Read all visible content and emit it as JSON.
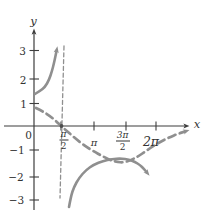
{
  "labels": {
    "y_axis": "y",
    "x_axis": "x",
    "y3": "3",
    "y2": "2",
    "y1": "1",
    "origin": "0",
    "ym1": "−1",
    "ym2": "−2",
    "ym3": "−3",
    "pi": "π",
    "two_pi": "2π",
    "pi_over_2_num": "π",
    "pi_over_2_den": "2",
    "three_pi_over_2_num": "3π",
    "three_pi_over_2_den": "2"
  },
  "chart_data": {
    "type": "line",
    "title": "",
    "xlabel": "x",
    "ylabel": "y",
    "x_tick_labels": [
      "π/2",
      "π",
      "3π/2",
      "2π"
    ],
    "y_tick_labels": [
      -3,
      -2,
      -1,
      1,
      2,
      3
    ],
    "xlim_rad": [
      0,
      7.9
    ],
    "ylim": [
      -3.5,
      3.5
    ],
    "grid": false,
    "legend": "none",
    "asymptote": {
      "style": "dashed-vertical",
      "x_label": "π/2"
    },
    "series": [
      {
        "name": "solid upper branch (rises to +infinity toward x = π/2)",
        "style": "solid",
        "points_est_units": [
          [
            0,
            1.3
          ],
          [
            0.35,
            1.6
          ],
          [
            0.75,
            2.3
          ],
          [
            1.1,
            3.1
          ]
        ]
      },
      {
        "name": "solid lower branch (U-shape opening downward near y = -1.3)",
        "style": "solid",
        "points_est_units": [
          [
            1.8,
            -3.2
          ],
          [
            2.3,
            -1.9
          ],
          [
            3.0,
            -1.5
          ],
          [
            3.7,
            -1.37
          ],
          [
            4.5,
            -1.33
          ],
          [
            5.2,
            -1.5
          ],
          [
            5.8,
            -1.9
          ]
        ]
      },
      {
        "name": "dashed guide curve (cosine-like)",
        "style": "dashed",
        "points_est_units": [
          [
            0.05,
            0.73
          ],
          [
            0.8,
            0.35
          ],
          [
            1.57,
            0
          ],
          [
            2.4,
            -0.65
          ],
          [
            3.14,
            -1.04
          ],
          [
            4.4,
            -1.47
          ],
          [
            5.76,
            -1.02
          ],
          [
            6.8,
            -0.53
          ],
          [
            7.8,
            -0.22
          ]
        ]
      }
    ]
  },
  "render": {
    "colors": {
      "curve": "#8f8f8f",
      "axis": "#3d3d3d",
      "text": "#333333",
      "dot": "#4d4d4d"
    },
    "axes": [
      {
        "name": "x-axis",
        "pts": [
          [
            4,
            126
          ],
          [
            185,
            126
          ]
        ],
        "w": 1.2,
        "marker": "arrow-dark"
      },
      {
        "name": "y-axis",
        "pts": [
          [
            34,
            210
          ],
          [
            34,
            33
          ]
        ],
        "w": 1.2,
        "marker": "arrow-dark"
      }
    ],
    "curves": [
      {
        "name": "secant-upper-branch-curve",
        "w": 2.6,
        "dash": null,
        "marker": "arrow-gray",
        "pts": [
          [
            35,
            94
          ],
          [
            40,
            91
          ],
          [
            45,
            87
          ],
          [
            49,
            80
          ],
          [
            52,
            71
          ],
          [
            54,
            63
          ],
          [
            55.5,
            56
          ],
          [
            56.5,
            51
          ]
        ]
      },
      {
        "name": "secant-lower-branch-curve",
        "w": 2.6,
        "dash": null,
        "marker": "arrow-gray",
        "pts": [
          [
            69,
            207
          ],
          [
            71,
            196
          ],
          [
            74,
            187
          ],
          [
            79,
            178
          ],
          [
            86,
            170
          ],
          [
            94,
            164.5
          ],
          [
            103,
            161
          ],
          [
            112,
            159
          ],
          [
            121,
            158.5
          ],
          [
            129,
            159.5
          ],
          [
            135,
            162
          ],
          [
            140,
            165
          ],
          [
            144,
            169
          ],
          [
            146.5,
            172
          ]
        ]
      },
      {
        "name": "cosine-dashed-curve",
        "w": 2.7,
        "dash": "7.5 4.5",
        "marker": "arrow-gray",
        "pts": [
          [
            36,
            108
          ],
          [
            43,
            111.5
          ],
          [
            50,
            116
          ],
          [
            56,
            121
          ],
          [
            61,
            126
          ],
          [
            68,
            132
          ],
          [
            76,
            139
          ],
          [
            85,
            146
          ],
          [
            94,
            151.5
          ],
          [
            102,
            156
          ],
          [
            110,
            160
          ],
          [
            117,
            162
          ],
          [
            124,
            162.5
          ],
          [
            131,
            160
          ],
          [
            138,
            156.5
          ],
          [
            146,
            151
          ],
          [
            154,
            145.5
          ],
          [
            162,
            141
          ],
          [
            170,
            137
          ],
          [
            178,
            133.8
          ],
          [
            185,
            131.5
          ]
        ]
      },
      {
        "name": "vertical-asymptote-line",
        "w": 1.3,
        "dash": "4 2.8",
        "marker": null,
        "pts": [
          [
            64,
            46
          ],
          [
            60,
            198
          ]
        ]
      }
    ],
    "ticks": [
      {
        "name": "y-tick-3",
        "x1": 29.5,
        "y1": 50.5,
        "x2": 39,
        "y2": 50.5
      },
      {
        "name": "y-tick-2",
        "x1": 29.5,
        "y1": 79,
        "x2": 39,
        "y2": 79
      },
      {
        "name": "y-tick-1",
        "x1": 29.5,
        "y1": 103.5,
        "x2": 39,
        "y2": 103.5
      },
      {
        "name": "y-tick-m1",
        "x1": 29.5,
        "y1": 150,
        "x2": 39,
        "y2": 150
      },
      {
        "name": "y-tick-m2",
        "x1": 29.5,
        "y1": 177,
        "x2": 39,
        "y2": 177
      },
      {
        "name": "y-tick-m3",
        "x1": 29.5,
        "y1": 200,
        "x2": 39,
        "y2": 200
      },
      {
        "name": "x-tick-pi-over-2",
        "x1": 61,
        "y1": 121.5,
        "x2": 61,
        "y2": 130.5
      },
      {
        "name": "x-tick-pi",
        "x1": 94,
        "y1": 121.5,
        "x2": 94,
        "y2": 130.5
      },
      {
        "name": "x-tick-3pi-over-2",
        "x1": 126,
        "y1": 121.5,
        "x2": 126,
        "y2": 130.5
      },
      {
        "name": "x-tick-2pi",
        "x1": 156,
        "y1": 121.5,
        "x2": 156,
        "y2": 130.5
      }
    ],
    "dots": [
      {
        "name": "curve-axis-intersection-dot",
        "x": 61.5,
        "y": 126,
        "r": 1.9
      }
    ],
    "labels": [
      {
        "name": "y-axis-label",
        "bind": "labels.y_axis",
        "x": 33.5,
        "y": 22,
        "size": 11.5,
        "it": true
      },
      {
        "name": "x-axis-label",
        "bind": "labels.x_axis",
        "x": 197,
        "y": 125,
        "size": 11.5,
        "it": true
      },
      {
        "name": "y-tick-label-3",
        "bind": "labels.y3",
        "x": 22.5,
        "y": 50.5,
        "size": 10.5
      },
      {
        "name": "y-tick-label-2",
        "bind": "labels.y2",
        "x": 23,
        "y": 79.5,
        "size": 10.5
      },
      {
        "name": "y-tick-label-1",
        "bind": "labels.y1",
        "x": 23.5,
        "y": 103.5,
        "size": 10.5
      },
      {
        "name": "origin-label",
        "bind": "labels.origin",
        "x": 28.5,
        "y": 135,
        "size": 10.5
      },
      {
        "name": "y-tick-label-m1",
        "bind": "labels.ym1",
        "x": 17,
        "y": 149.5,
        "size": 10.5
      },
      {
        "name": "y-tick-label-m2",
        "bind": "labels.ym2",
        "x": 16,
        "y": 176.5,
        "size": 10.5
      },
      {
        "name": "y-tick-label-m3",
        "bind": "labels.ym3",
        "x": 16.5,
        "y": 199.5,
        "size": 10.5
      },
      {
        "name": "x-tick-label-pi",
        "bind": "labels.pi",
        "x": 94,
        "y": 142.5,
        "size": 10,
        "it": true
      },
      {
        "name": "x-tick-label-2pi",
        "bind": "labels.two_pi",
        "x": 151,
        "y": 142,
        "size": 12.5,
        "it": true
      }
    ],
    "fractions": [
      {
        "name": "x-tick-label-pi-over-2",
        "numBind": "labels.pi_over_2_num",
        "denBind": "labels.pi_over_2_den",
        "x": 63.5,
        "y": 140,
        "size": 9,
        "barW": 9
      },
      {
        "name": "x-tick-label-3pi-over-2",
        "numBind": "labels.three_pi_over_2_num",
        "denBind": "labels.three_pi_over_2_den",
        "x": 122.5,
        "y": 141,
        "size": 9,
        "barW": 14
      }
    ]
  }
}
